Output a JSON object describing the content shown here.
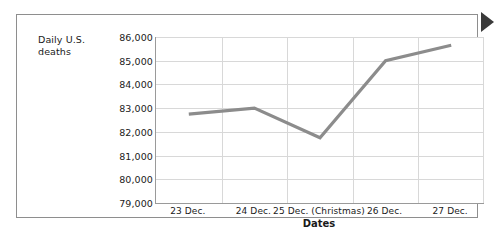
{
  "chart_data": {
    "type": "line",
    "title": "",
    "xlabel": "Dates",
    "ylabel": "Daily U.S. deaths",
    "categories": [
      "23 Dec.",
      "24 Dec.",
      "25 Dec. (Christmas)",
      "26 Dec.",
      "27 Dec."
    ],
    "values": [
      82750,
      83000,
      81750,
      85000,
      85650
    ],
    "series": [
      {
        "name": "Daily U.S. deaths",
        "values": [
          82750,
          83000,
          81750,
          85000,
          85650
        ]
      }
    ],
    "ylim": [
      79000,
      86000
    ],
    "ytick_labels": [
      "86,000",
      "85,000",
      "84,000",
      "83,000",
      "82,000",
      "81,000",
      "80,000",
      "79,000"
    ],
    "ytick_values": [
      86000,
      85000,
      84000,
      83000,
      82000,
      81000,
      80000,
      79000
    ],
    "grid": true,
    "legend": false,
    "line_color": "#8c8c8c",
    "grid_color": "#d8d8d8",
    "axis_color": "#9a9a9a"
  },
  "marker": {
    "pointer_label": "right-pointer-triangle"
  }
}
